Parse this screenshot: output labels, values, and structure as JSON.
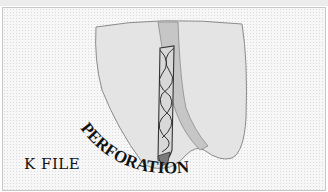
{
  "figure": {
    "title_curved": "PERFORATION",
    "instrument_label": "K FILE",
    "colors": {
      "tooth": "#e3e3e3",
      "canal": "#c9c9c9",
      "file_body": "#d6d6d6",
      "file_tip": "#7a7a7a",
      "outline": "#3a3a3a",
      "text": "#111111"
    }
  }
}
